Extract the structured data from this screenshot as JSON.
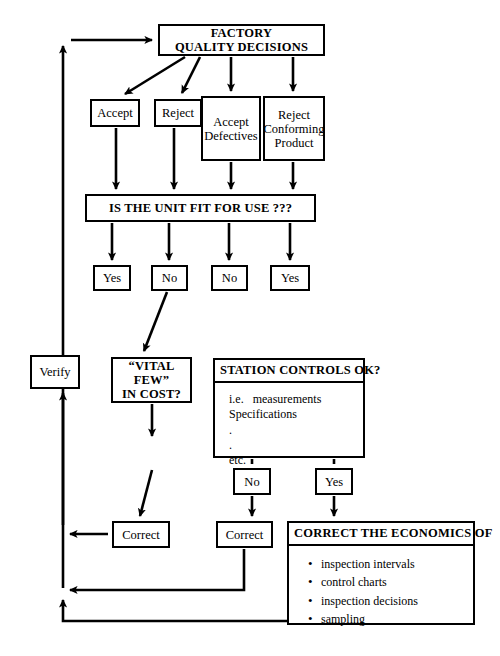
{
  "diagram": {
    "title_node": {
      "id": "factory-quality-decisions",
      "lines": [
        "FACTORY",
        "QUALITY DECISIONS"
      ],
      "x": 158,
      "y": 24,
      "w": 167,
      "h": 32,
      "style": "bold"
    },
    "decision_nodes": [
      {
        "id": "accept",
        "lines": [
          "Accept"
        ],
        "x": 90,
        "y": 99,
        "w": 50,
        "h": 28,
        "style": "plain"
      },
      {
        "id": "reject",
        "lines": [
          "Reject"
        ],
        "x": 154,
        "y": 99,
        "w": 48,
        "h": 28,
        "style": "plain"
      },
      {
        "id": "accept-defectives",
        "lines": [
          "Accept",
          "Defectives"
        ],
        "x": 201,
        "y": 96,
        "w": 60,
        "h": 65,
        "style": "plain"
      },
      {
        "id": "reject-conforming-product",
        "lines": [
          "Reject",
          "Conforming",
          "Product"
        ],
        "x": 263,
        "y": 96,
        "w": 62,
        "h": 65,
        "style": "plain"
      }
    ],
    "fit_for_use": {
      "id": "is-the-unit-fit-for-use",
      "lines": [
        "IS THE UNIT FIT FOR USE ???"
      ],
      "x": 85,
      "y": 194,
      "w": 231,
      "h": 28,
      "style": "bold"
    },
    "answer_nodes": [
      {
        "id": "answer-yes-1",
        "lines": [
          "Yes"
        ],
        "x": 93,
        "y": 265,
        "w": 38,
        "h": 26,
        "style": "plain"
      },
      {
        "id": "answer-no-1",
        "lines": [
          "No"
        ],
        "x": 151,
        "y": 265,
        "w": 37,
        "h": 26,
        "style": "plain"
      },
      {
        "id": "answer-no-2",
        "lines": [
          "No"
        ],
        "x": 211,
        "y": 265,
        "w": 37,
        "h": 26,
        "style": "plain"
      },
      {
        "id": "answer-yes-2",
        "lines": [
          "Yes"
        ],
        "x": 270,
        "y": 265,
        "w": 40,
        "h": 26,
        "style": "plain"
      }
    ],
    "verify_node": {
      "id": "verify",
      "lines": [
        "Verify"
      ],
      "x": 30,
      "y": 355,
      "w": 50,
      "h": 34,
      "style": "plain"
    },
    "vital_few_node": {
      "id": "vital-few-in-cost",
      "lines": [
        "“VITAL FEW”",
        "IN COST?"
      ],
      "x": 111,
      "y": 357,
      "w": 81,
      "h": 46,
      "style": "bold"
    },
    "station_controls": {
      "id": "station-controls-ok",
      "header": "STATION CONTROLS OK?",
      "body_lines": [
        "i.e.   measurements",
        "Specifications",
        ".",
        ".",
        "etc."
      ],
      "x": 213,
      "y": 358,
      "w": 152,
      "h": 100
    },
    "station_answers": [
      {
        "id": "station-answer-no",
        "lines": [
          "No"
        ],
        "x": 233,
        "y": 468,
        "w": 38,
        "h": 27,
        "style": "plain"
      },
      {
        "id": "station-answer-yes",
        "lines": [
          "Yes"
        ],
        "x": 315,
        "y": 468,
        "w": 38,
        "h": 27,
        "style": "plain"
      }
    ],
    "correct_nodes": [
      {
        "id": "correct-left",
        "lines": [
          "Correct"
        ],
        "x": 112,
        "y": 521,
        "w": 58,
        "h": 27,
        "style": "plain"
      },
      {
        "id": "correct-right",
        "lines": [
          "Correct"
        ],
        "x": 216,
        "y": 521,
        "w": 57,
        "h": 27,
        "style": "plain"
      }
    ],
    "economics": {
      "id": "correct-the-economics-of",
      "header": "CORRECT THE ECONOMICS OF",
      "bullets": [
        "inspection intervals",
        "control charts",
        "inspection decisions",
        "sampling"
      ],
      "x": 287,
      "y": 521,
      "w": 188,
      "h": 104
    },
    "colors": {
      "stroke": "#000000",
      "background": "#ffffff",
      "text": "#000000"
    }
  }
}
